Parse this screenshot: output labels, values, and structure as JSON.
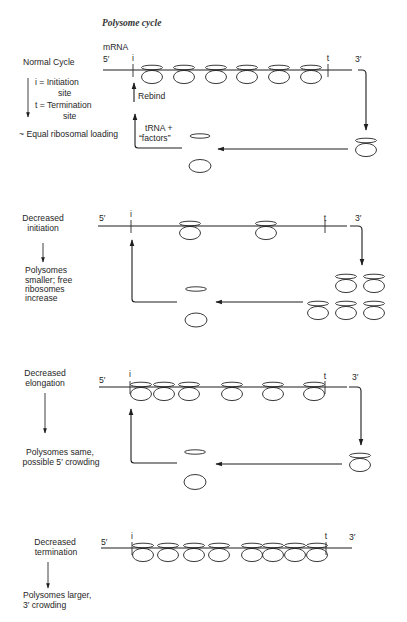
{
  "title": "Polysome cycle",
  "panels": [
    {
      "name": "normal-cycle",
      "condition": [
        "Normal Cycle"
      ],
      "legend": {
        "i_def": "i = Initiation",
        "i_def_cont": "site",
        "t_def": "t = Termination",
        "t_def_cont": "site"
      },
      "outcome": [
        "~ Equal ribosomal loading"
      ],
      "mrna_label": "mRNA",
      "five_prime": "5′",
      "three_prime": "3′",
      "initiation_marker": "i",
      "termination_marker": "t",
      "rebind_label": "Rebind",
      "factors_label": [
        "tRNA +",
        "“factors”"
      ],
      "bound_ribosome_count": 6,
      "bound_ribosomes": [
        {
          "cx": 152,
          "y": 70
        },
        {
          "cx": 184,
          "y": 70
        },
        {
          "cx": 216,
          "y": 70
        },
        {
          "cx": 247,
          "y": 70
        },
        {
          "cx": 279,
          "y": 70
        },
        {
          "cx": 311,
          "y": 70
        }
      ],
      "released_ribosomes": [
        {
          "cx": 366,
          "y": 143
        }
      ]
    },
    {
      "name": "decreased-initiation",
      "condition": [
        "Decreased",
        "initiation"
      ],
      "outcome": [
        "Polysomes",
        "smaller; free",
        "ribosomes",
        "increase"
      ],
      "five_prime": "5′",
      "three_prime": "3′",
      "initiation_marker": "i",
      "termination_marker": "t",
      "bound_ribosome_count": 2,
      "bound_ribosomes": [
        {
          "cx": 190,
          "y": 226
        },
        {
          "cx": 266,
          "y": 226
        }
      ],
      "released_ribosomes": [
        {
          "cx": 346,
          "y": 279
        },
        {
          "cx": 374,
          "y": 279
        },
        {
          "cx": 318,
          "y": 306
        },
        {
          "cx": 346,
          "y": 306
        },
        {
          "cx": 374,
          "y": 306
        }
      ]
    },
    {
      "name": "decreased-elongation",
      "condition": [
        "Decreased",
        "elongation"
      ],
      "outcome": [
        "Polysomes same,",
        "possible 5′ crowding"
      ],
      "five_prime": "5′",
      "three_prime": "3′",
      "initiation_marker": "i",
      "termination_marker": "t",
      "bound_ribosome_count": 6,
      "bound_ribosomes": [
        {
          "cx": 141,
          "y": 387
        },
        {
          "cx": 164,
          "y": 387
        },
        {
          "cx": 189,
          "y": 387
        },
        {
          "cx": 232,
          "y": 387
        },
        {
          "cx": 273,
          "y": 387
        },
        {
          "cx": 314,
          "y": 387
        }
      ],
      "released_ribosomes": [
        {
          "cx": 360,
          "y": 458
        }
      ]
    },
    {
      "name": "decreased-termination",
      "condition": [
        "Decreased",
        "termination"
      ],
      "outcome": [
        "Polysomes larger,",
        "3′ crowding"
      ],
      "five_prime": "5′",
      "three_prime": "3′",
      "initiation_marker": "i",
      "termination_marker": "t",
      "bound_ribosome_count": 8,
      "bound_ribosomes": [
        {
          "cx": 143,
          "y": 548
        },
        {
          "cx": 168,
          "y": 548
        },
        {
          "cx": 194,
          "y": 548
        },
        {
          "cx": 219,
          "y": 548
        },
        {
          "cx": 252,
          "y": 548
        },
        {
          "cx": 273,
          "y": 548
        },
        {
          "cx": 295,
          "y": 548
        },
        {
          "cx": 317,
          "y": 548
        }
      ],
      "released_ribosomes": []
    }
  ]
}
